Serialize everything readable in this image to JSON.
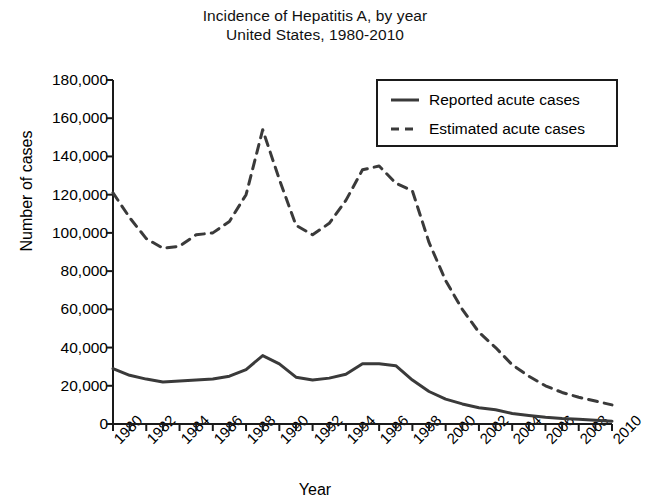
{
  "chart_data": {
    "type": "line",
    "title": "Incidence of Hepatitis A, by year",
    "subtitle": "United States, 1980-2010",
    "xlabel": "Year",
    "ylabel": "Number of cases",
    "xlim": [
      1980,
      2010
    ],
    "ylim": [
      0,
      180000
    ],
    "ytick_values": [
      0,
      20000,
      40000,
      60000,
      80000,
      100000,
      120000,
      140000,
      160000,
      180000
    ],
    "ytick_labels": [
      "0",
      "20,000",
      "40,000",
      "60,000",
      "80,000",
      "100,000",
      "120,000",
      "140,000",
      "160,000",
      "180,000"
    ],
    "xtick_values": [
      1980,
      1982,
      1984,
      1986,
      1988,
      1990,
      1992,
      1994,
      1996,
      1998,
      2000,
      2002,
      2004,
      2006,
      2008,
      2010
    ],
    "xtick_labels": [
      "1980",
      "1982",
      "1984",
      "1986",
      "1988",
      "1990",
      "1992",
      "1994",
      "1996",
      "1998",
      "2000",
      "2002",
      "2004",
      "2006",
      "2008",
      "2010"
    ],
    "xtick_minor_step": 1,
    "grid": false,
    "legend_position": "top-right",
    "x": [
      1980,
      1981,
      1982,
      1983,
      1984,
      1985,
      1986,
      1987,
      1988,
      1989,
      1990,
      1991,
      1992,
      1993,
      1994,
      1995,
      1996,
      1997,
      1998,
      1999,
      2000,
      2001,
      2002,
      2003,
      2004,
      2005,
      2006,
      2007,
      2008,
      2009,
      2010
    ],
    "series": [
      {
        "name": "Reported acute cases",
        "style": "solid",
        "color": "#3a3a3a",
        "values": [
          29000,
          25500,
          23500,
          22000,
          22500,
          23000,
          23500,
          25000,
          28500,
          35800,
          31500,
          24500,
          23000,
          24000,
          26000,
          31500,
          31500,
          30500,
          23000,
          17000,
          13000,
          10500,
          8500,
          7500,
          5500,
          4500,
          3500,
          2900,
          2500,
          2000,
          1500
        ]
      },
      {
        "name": "Estimated acute cases",
        "style": "dashed",
        "color": "#3a3a3a",
        "values": [
          121000,
          108000,
          97000,
          92000,
          93000,
          99000,
          100000,
          106000,
          120000,
          154000,
          128000,
          104000,
          99000,
          105000,
          117000,
          133000,
          135000,
          126000,
          122000,
          95000,
          75000,
          60000,
          48000,
          40000,
          31000,
          25000,
          20000,
          16500,
          14000,
          12000,
          10000
        ]
      }
    ],
    "annotations": []
  },
  "legend": {
    "items": [
      {
        "label": "Reported acute cases",
        "style": "solid"
      },
      {
        "label": "Estimated acute cases",
        "style": "dashed"
      }
    ]
  }
}
